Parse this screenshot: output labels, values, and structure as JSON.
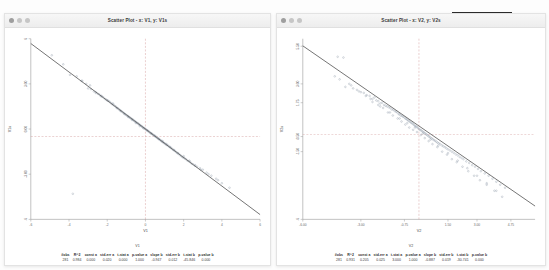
{
  "desktop": {
    "background": "#fdfdfd"
  },
  "windows": [
    {
      "id": "left",
      "title": "Scatter Plot - x: V1, y: V1s",
      "traffic_lights": [
        "close-dot",
        "minimize-dot",
        "zoom-dot"
      ],
      "stats_var_label": "V1",
      "stats_headers": [
        "#obs",
        "R^2",
        "const a",
        "std-err a",
        "t-stat a",
        "p-value a",
        "slope b",
        "std-err b",
        "t-stat b",
        "p-value b"
      ],
      "stats_values": [
        "281",
        "0.984",
        "0.000",
        "0.020",
        "0.000",
        "1.000",
        "-0.947",
        "0.012",
        "-45.846",
        "0.000"
      ]
    },
    {
      "id": "right",
      "title": "Scatter Plot - x: V2, y: V2s",
      "traffic_lights": [
        "close-dot",
        "minimize-dot",
        "zoom-dot"
      ],
      "stats_var_label": "V2",
      "stats_headers": [
        "#obs",
        "R^2",
        "const a",
        "std-err a",
        "t-stat a",
        "p-value a",
        "slope b",
        "std-err b",
        "t-stat b",
        "p-value b"
      ],
      "stats_values": [
        "281",
        "0.931",
        "0.205",
        "0.025",
        "3.000",
        "1.000",
        "-0.887",
        "0.019",
        "-30.741",
        "0.000"
      ]
    }
  ],
  "chart_data": [
    {
      "type": "scatter",
      "title": "Scatter Plot - x: V1, y: V1s",
      "xlabel": "V1",
      "ylabel": "V1s",
      "xlim": [
        -6,
        6
      ],
      "ylim": [
        -6,
        6
      ],
      "xticks": [
        -6,
        -4,
        -2,
        0,
        2,
        4,
        6
      ],
      "xticklabels": [
        "-6",
        "-4",
        "-2",
        "0",
        "2",
        "4",
        "6"
      ],
      "yticks": [
        -6,
        -3,
        0,
        3,
        6
      ],
      "yticklabels": [
        "-6",
        "-3.00",
        "0.00",
        "3.00",
        "6"
      ],
      "grid": false,
      "legend": null,
      "n_points": 281,
      "regression": {
        "intercept": 0.0,
        "slope": -0.947,
        "r_squared": 0.984,
        "line_color": "#5a5a5a"
      },
      "crosshair": {
        "x": 0.0,
        "y": -0.5,
        "style": "dashed",
        "color": "#cf8f8f"
      },
      "point_color": "#8f9aa8",
      "points_x": [
        -4.9,
        -4.3,
        -3.95,
        -3.6,
        -3.35,
        -3.1,
        -3.0,
        -2.85,
        -2.7,
        -2.6,
        -2.5,
        -2.42,
        -2.35,
        -2.28,
        -2.2,
        -2.12,
        -2.05,
        -1.98,
        -1.92,
        -1.86,
        -1.8,
        -1.74,
        -1.68,
        -1.62,
        -1.56,
        -1.5,
        -1.45,
        -1.4,
        -1.35,
        -1.3,
        -1.25,
        -1.2,
        -1.15,
        -1.1,
        -1.05,
        -1.0,
        -0.96,
        -0.92,
        -0.88,
        -0.84,
        -0.8,
        -0.76,
        -0.72,
        -0.68,
        -0.64,
        -0.6,
        -0.56,
        -0.52,
        -0.48,
        -0.44,
        -0.4,
        -0.36,
        -0.32,
        -0.28,
        -0.24,
        -0.2,
        -0.16,
        -0.12,
        -0.08,
        -0.04,
        0.0,
        0.04,
        0.08,
        0.12,
        0.16,
        0.2,
        0.24,
        0.28,
        0.32,
        0.36,
        0.4,
        0.44,
        0.48,
        0.52,
        0.56,
        0.6,
        0.64,
        0.68,
        0.72,
        0.76,
        0.8,
        0.84,
        0.88,
        0.92,
        0.96,
        1.0,
        1.05,
        1.1,
        1.15,
        1.2,
        1.25,
        1.3,
        1.35,
        1.4,
        1.45,
        1.5,
        1.56,
        1.62,
        1.68,
        1.74,
        1.8,
        1.86,
        1.92,
        1.98,
        2.05,
        2.12,
        2.2,
        2.28,
        2.35,
        2.42,
        2.5,
        2.6,
        2.7,
        2.85,
        3.0,
        3.2,
        3.45,
        3.7,
        4.0,
        4.4,
        -3.8,
        -3.3,
        -2.9,
        -2.6,
        -2.3,
        -2.0,
        -1.7,
        -1.5,
        -1.3,
        -1.1,
        -0.9,
        -0.7,
        -0.5,
        -0.3,
        -0.1,
        0.1,
        0.3,
        0.5,
        0.7,
        0.9,
        1.1,
        1.3,
        1.5,
        1.7,
        2.0,
        2.3,
        2.6,
        2.9,
        3.3,
        3.8
      ],
      "points_y": [
        4.9,
        4.3,
        3.6,
        3.5,
        3.2,
        3.0,
        2.7,
        2.65,
        2.5,
        2.45,
        2.35,
        2.3,
        2.2,
        2.15,
        2.1,
        2.0,
        1.95,
        1.9,
        1.85,
        1.8,
        1.72,
        1.65,
        1.6,
        1.55,
        1.5,
        1.42,
        1.38,
        1.32,
        1.28,
        1.22,
        1.18,
        1.12,
        1.08,
        1.02,
        0.98,
        0.92,
        0.9,
        0.86,
        0.82,
        0.78,
        0.75,
        0.7,
        0.68,
        0.64,
        0.6,
        0.56,
        0.52,
        0.48,
        0.45,
        0.4,
        0.38,
        0.34,
        0.3,
        0.26,
        0.22,
        0.18,
        0.14,
        0.1,
        0.07,
        0.03,
        0.0,
        -0.04,
        -0.08,
        -0.12,
        -0.15,
        -0.2,
        -0.23,
        -0.27,
        -0.3,
        -0.34,
        -0.38,
        -0.42,
        -0.45,
        -0.5,
        -0.53,
        -0.57,
        -0.6,
        -0.65,
        -0.68,
        -0.72,
        -0.76,
        -0.8,
        -0.84,
        -0.88,
        -0.92,
        -0.95,
        -1.0,
        -1.05,
        -1.08,
        -1.12,
        -1.18,
        -1.22,
        -1.28,
        -1.32,
        -1.38,
        -1.42,
        -1.48,
        -1.55,
        -1.6,
        -1.65,
        -1.72,
        -1.78,
        -1.85,
        -1.9,
        -1.95,
        -2.0,
        -2.1,
        -2.15,
        -2.2,
        -2.3,
        -2.35,
        -2.45,
        -2.5,
        -2.6,
        -2.7,
        -2.9,
        -3.1,
        -3.3,
        -3.6,
        -3.9,
        -4.3,
        3.2,
        2.9,
        2.4,
        2.2,
        1.9,
        1.7,
        1.4,
        1.2,
        1.0,
        0.8,
        0.6,
        0.4,
        0.2,
        0.05,
        -0.1,
        -0.3,
        -0.45,
        -0.65,
        -0.8,
        -1.0,
        -1.2,
        -1.4,
        -1.6,
        -1.8,
        -2.1,
        -2.4,
        -2.7,
        -3.0,
        -3.4,
        -3.9
      ]
    },
    {
      "type": "scatter",
      "title": "Scatter Plot - x: V2, y: V2s",
      "xlabel": "V2",
      "ylabel": "V2s",
      "xlim": [
        -6,
        6
      ],
      "ylim": [
        -6,
        6
      ],
      "xticks": [
        -6,
        -3,
        -0.75,
        1.5,
        3,
        4.75
      ],
      "xticklabels": [
        "-6.00",
        "-3.00",
        "-0.75",
        "1.50",
        "3.00",
        "4.75"
      ],
      "yticks": [
        5.5,
        3.0,
        1.75,
        -0.5,
        -1.5,
        -6
      ],
      "yticklabels": [
        "5.50",
        "3.00",
        "1.75",
        "-0.50",
        "-1.50",
        "-6"
      ],
      "grid": false,
      "legend": null,
      "n_points": 281,
      "regression": {
        "intercept": 0.205,
        "slope": -0.887,
        "r_squared": 0.931,
        "line_color": "#5a5a5a"
      },
      "crosshair": {
        "x": 0.0,
        "y": -0.35,
        "style": "dashed",
        "color": "#cf8f8f"
      },
      "point_color": "#8f9aa8",
      "points_x": [
        -4.2,
        -3.9,
        -4.35,
        -4.1,
        -3.8,
        -3.6,
        -3.4,
        -3.2,
        -3.0,
        -2.85,
        -2.7,
        -2.55,
        -2.4,
        -2.3,
        -2.2,
        -2.1,
        -2.0,
        -1.9,
        -1.8,
        -1.72,
        -1.64,
        -1.56,
        -1.48,
        -1.4,
        -1.32,
        -1.25,
        -1.18,
        -1.12,
        -1.05,
        -1.0,
        -0.94,
        -0.88,
        -0.82,
        -0.76,
        -0.7,
        -0.65,
        -0.6,
        -0.55,
        -0.5,
        -0.45,
        -0.4,
        -0.35,
        -0.3,
        -0.25,
        -0.2,
        -0.15,
        -0.1,
        -0.05,
        0.0,
        0.05,
        0.1,
        0.15,
        0.2,
        0.25,
        0.3,
        0.35,
        0.4,
        0.45,
        0.5,
        0.55,
        0.6,
        0.66,
        0.72,
        0.78,
        0.84,
        0.9,
        0.96,
        1.02,
        1.1,
        1.18,
        1.26,
        1.34,
        1.42,
        1.5,
        1.6,
        1.7,
        1.8,
        1.9,
        2.0,
        2.1,
        2.2,
        2.3,
        2.45,
        2.6,
        2.75,
        2.9,
        3.05,
        3.2,
        3.4,
        3.6,
        3.8,
        4.0,
        4.2,
        4.45,
        -3.5,
        -3.1,
        -2.75,
        -2.4,
        -2.1,
        -1.85,
        -1.6,
        -1.35,
        -1.1,
        -0.9,
        -0.7,
        -0.5,
        -0.3,
        -0.1,
        0.1,
        0.3,
        0.5,
        0.7,
        0.95,
        1.2,
        1.45,
        1.7,
        1.95,
        2.25,
        2.55,
        2.85,
        3.15,
        3.5,
        3.9,
        4.3,
        -2.5,
        -2.0,
        -1.5,
        -1.0,
        -0.6,
        -0.2,
        0.2,
        0.6,
        1.0,
        1.5,
        2.0,
        2.5,
        3.0,
        3.5,
        4.0
      ],
      "points_y": [
        4.8,
        4.75,
        3.5,
        3.3,
        2.8,
        3.0,
        2.7,
        2.6,
        2.45,
        2.4,
        2.25,
        2.2,
        2.0,
        2.1,
        1.9,
        1.85,
        1.7,
        1.75,
        1.6,
        1.55,
        1.5,
        1.45,
        1.4,
        1.3,
        1.28,
        1.2,
        1.15,
        1.1,
        1.0,
        0.98,
        0.9,
        0.88,
        0.82,
        0.78,
        0.7,
        0.68,
        0.62,
        0.58,
        0.52,
        0.48,
        0.42,
        0.38,
        0.32,
        0.28,
        0.2,
        0.18,
        0.12,
        0.08,
        0.0,
        -0.04,
        -0.08,
        -0.12,
        -0.18,
        -0.22,
        -0.28,
        -0.32,
        -0.38,
        -0.42,
        -0.48,
        -0.52,
        -0.58,
        -0.62,
        -0.68,
        -0.74,
        -0.78,
        -0.84,
        -0.9,
        -0.95,
        -1.0,
        -1.08,
        -1.15,
        -1.2,
        -1.28,
        -1.35,
        -1.42,
        -1.5,
        -1.58,
        -1.68,
        -1.75,
        -1.85,
        -1.92,
        -2.0,
        -2.15,
        -2.25,
        -2.4,
        -2.5,
        -2.65,
        -2.8,
        -2.95,
        -3.1,
        -3.3,
        -3.5,
        -3.7,
        -3.9,
        2.9,
        2.5,
        2.2,
        1.8,
        1.6,
        1.4,
        1.1,
        0.9,
        0.7,
        0.5,
        0.3,
        0.1,
        -0.05,
        -0.2,
        -0.4,
        -0.6,
        -0.8,
        -1.0,
        -1.2,
        -1.5,
        -1.7,
        -2.0,
        -2.2,
        -2.5,
        -2.8,
        -3.1,
        -3.4,
        -3.7,
        -4.1,
        -4.5,
        2.0,
        1.5,
        1.1,
        0.7,
        0.4,
        0.1,
        -0.3,
        -0.7,
        -1.1,
        -1.6,
        -2.1,
        -2.6,
        -3.1,
        -3.6,
        -4.1
      ]
    }
  ]
}
